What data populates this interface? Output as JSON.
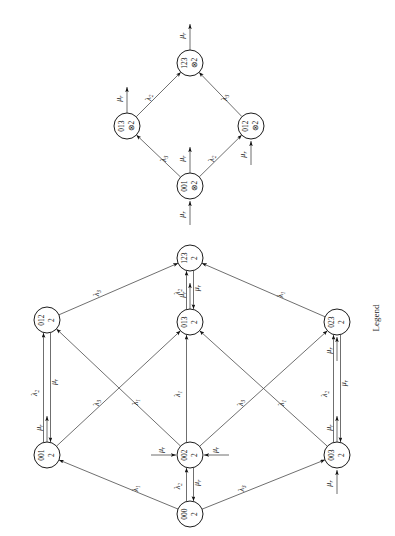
{
  "figure": {
    "title": "",
    "legend_label": "Legend",
    "rotation_degrees": 90,
    "background_color": "#ffffff",
    "line_color": "#4a4a4a",
    "node_stroke_color": "#1c1c1c"
  },
  "graphs": [
    {
      "id": "upper-diamond",
      "name": "reduced-state-diagram",
      "nodes": [
        {
          "id": "u123",
          "label_top": "123",
          "label_bottom": "⊗2",
          "x": 190,
          "y": 63
        },
        {
          "id": "u013",
          "label_top": "013",
          "label_bottom": "⊗2",
          "x": 127,
          "y": 126
        },
        {
          "id": "u012",
          "label_top": "012",
          "label_bottom": "⊗2",
          "x": 251,
          "y": 126
        },
        {
          "id": "u001",
          "label_top": "001",
          "label_bottom": "⊗2",
          "x": 190,
          "y": 186
        }
      ],
      "edges": [
        {
          "from": "u013",
          "to": "u123",
          "label": "λ",
          "sub": "2"
        },
        {
          "from": "u012",
          "to": "u123",
          "label": "λ",
          "sub": "3"
        },
        {
          "from": "u001",
          "to": "u013",
          "label": "λ",
          "sub": "3"
        },
        {
          "from": "u001",
          "to": "u012",
          "label": "λ",
          "sub": "2"
        }
      ],
      "external_arrows": [
        {
          "node": "u123",
          "label": "μ",
          "sub": "r",
          "direction": "out"
        },
        {
          "node": "u013",
          "label": "μ",
          "sub": "r",
          "direction": "out"
        },
        {
          "node": "u012",
          "label": "μ",
          "sub": "r",
          "direction": "in"
        },
        {
          "node": "u001",
          "label": "μ",
          "sub": "r",
          "direction": "out"
        },
        {
          "node": "u001",
          "label": "μ",
          "sub": "r",
          "direction": "in"
        }
      ]
    },
    {
      "id": "lower-lattice",
      "name": "full-state-diagram",
      "nodes": [
        {
          "id": "l123",
          "label_top": "123",
          "label_bottom": "2",
          "x": 190,
          "y": 258
        },
        {
          "id": "l012",
          "label_top": "012",
          "label_bottom": "2",
          "x": 47,
          "y": 320
        },
        {
          "id": "l013",
          "label_top": "013",
          "label_bottom": "2",
          "x": 190,
          "y": 322
        },
        {
          "id": "l023",
          "label_top": "023",
          "label_bottom": "2",
          "x": 337,
          "y": 322
        },
        {
          "id": "l001",
          "label_top": "001",
          "label_bottom": "2",
          "x": 47,
          "y": 455
        },
        {
          "id": "l002",
          "label_top": "002",
          "label_bottom": "2",
          "x": 190,
          "y": 455
        },
        {
          "id": "l003",
          "label_top": "003",
          "label_bottom": "2",
          "x": 337,
          "y": 455
        },
        {
          "id": "l000",
          "label_top": "000",
          "label_bottom": "2",
          "x": 190,
          "y": 514
        }
      ],
      "edges": [
        {
          "from": "l012",
          "to": "l123",
          "label": "λ",
          "sub": "3"
        },
        {
          "from": "l013",
          "to": "l123",
          "label": "λ",
          "sub": "2"
        },
        {
          "from": "l123",
          "to": "l013",
          "label": "μ",
          "sub": "r"
        },
        {
          "from": "l023",
          "to": "l123",
          "label": "λ",
          "sub": "1"
        },
        {
          "from": "l001",
          "to": "l012",
          "label": "λ",
          "sub": "2"
        },
        {
          "from": "l012",
          "to": "l001",
          "label": "μ",
          "sub": "r"
        },
        {
          "from": "l002",
          "to": "l012",
          "label": "λ",
          "sub": "1"
        },
        {
          "from": "l001",
          "to": "l013",
          "label": "λ",
          "sub": "3"
        },
        {
          "from": "l002",
          "to": "l013",
          "label": "λ",
          "sub": "1"
        },
        {
          "from": "l003",
          "to": "l013",
          "label": "λ",
          "sub": "1"
        },
        {
          "from": "l002",
          "to": "l023",
          "label": "λ",
          "sub": "3"
        },
        {
          "from": "l003",
          "to": "l023",
          "label": "λ",
          "sub": "2"
        },
        {
          "from": "l023",
          "to": "l003",
          "label": "μ",
          "sub": "r"
        },
        {
          "from": "l000",
          "to": "l001",
          "label": "λ",
          "sub": "1"
        },
        {
          "from": "l000",
          "to": "l002",
          "label": "λ",
          "sub": "2"
        },
        {
          "from": "l002",
          "to": "l000",
          "label": "μ",
          "sub": "r"
        },
        {
          "from": "l000",
          "to": "l003",
          "label": "λ",
          "sub": "3"
        }
      ],
      "external_arrows": [
        {
          "node": "l013",
          "label": "μ",
          "sub": "r",
          "direction": "out"
        },
        {
          "node": "l023",
          "label": "μ",
          "sub": "r",
          "direction": "in"
        },
        {
          "node": "l001",
          "label": "μ",
          "sub": "r",
          "direction": "out"
        },
        {
          "node": "l002",
          "label": "μ",
          "sub": "r",
          "direction": "in-left"
        },
        {
          "node": "l002",
          "label": "μ",
          "sub": "r",
          "direction": "in-right"
        },
        {
          "node": "l003",
          "label": "μ",
          "sub": "r",
          "direction": "in"
        },
        {
          "node": "l003",
          "label": "μ",
          "sub": "r",
          "direction": "out"
        }
      ]
    }
  ],
  "symbols": {
    "lambda": "λ",
    "mu": "μ",
    "otimes": "⊗",
    "sub_1": "1",
    "sub_2": "2",
    "sub_3": "3",
    "sub_r": "r"
  }
}
